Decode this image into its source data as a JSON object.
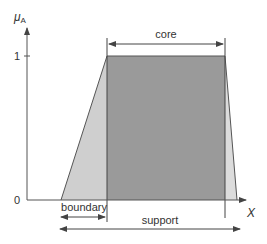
{
  "diagram": {
    "y_axis_label": "μ",
    "y_axis_subscript": "A",
    "x_axis_label": "X",
    "y_ticks": [
      {
        "label": "1",
        "value": 1
      },
      {
        "label": "0",
        "value": 0
      }
    ],
    "regions": {
      "core_label": "core",
      "boundary_label": "boundary",
      "support_label": "support"
    },
    "colors": {
      "core_fill": "#9a9a9a",
      "boundary_fill": "#cfcfcf",
      "axis": "#555555",
      "line": "#444444"
    }
  }
}
